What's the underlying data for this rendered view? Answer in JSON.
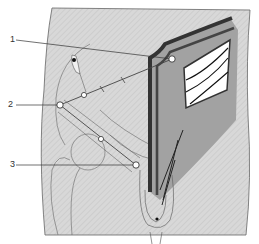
{
  "diagram": {
    "type": "anatomical-illustration",
    "labels": [
      {
        "id": "1",
        "text": "1",
        "x": 10,
        "y": 37,
        "target_x": 172,
        "target_y": 59
      },
      {
        "id": "2",
        "text": "2",
        "x": 8,
        "y": 100,
        "target_x": 60,
        "target_y": 105
      },
      {
        "id": "3",
        "text": "3",
        "x": 10,
        "y": 160,
        "target_x": 136,
        "target_y": 165
      }
    ],
    "colors": {
      "background": "#ffffff",
      "skin": "#d6d6d6",
      "outline": "#555555",
      "muscle_dark": "#3a3a3a",
      "muscle_stripes": "#7a7a7a",
      "window": "#ffffff",
      "marker_fill": "#ffffff"
    }
  }
}
